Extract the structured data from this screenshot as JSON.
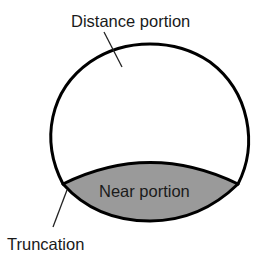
{
  "diagram": {
    "type": "bifocal-lens-segment",
    "labels": {
      "distance": "Distance portion",
      "near": "Near portion",
      "truncation": "Truncation"
    },
    "colors": {
      "outline": "#000000",
      "near_fill": "#9a9a9a",
      "background": "#ffffff",
      "text": "#1a1a1a"
    }
  }
}
